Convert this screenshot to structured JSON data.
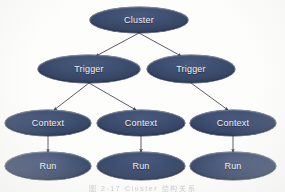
{
  "diagram": {
    "background_color": "#fdfdfc",
    "node_fill_color": "#3f4f71",
    "node_text_color": "#f2f3f6",
    "edge_color": "#4a4a52",
    "levels": [
      {
        "name": "cluster-level",
        "nodes": [
          {
            "id": "cluster",
            "label": "Cluster",
            "cx": 139,
            "cy": 20,
            "rx": 49,
            "ry": 13
          }
        ]
      },
      {
        "name": "trigger-level",
        "nodes": [
          {
            "id": "trigger-left",
            "label": "Trigger",
            "cx": 89,
            "cy": 69,
            "rx": 51,
            "ry": 14
          },
          {
            "id": "trigger-right",
            "label": "Trigger",
            "cx": 191,
            "cy": 69,
            "rx": 44,
            "ry": 14
          }
        ]
      },
      {
        "name": "context-level",
        "nodes": [
          {
            "id": "context-1",
            "label": "Context",
            "cx": 48,
            "cy": 123,
            "rx": 43,
            "ry": 13
          },
          {
            "id": "context-2",
            "label": "Context",
            "cx": 141,
            "cy": 123,
            "rx": 44,
            "ry": 13
          },
          {
            "id": "context-3",
            "label": "Context",
            "cx": 233,
            "cy": 123,
            "rx": 43,
            "ry": 13
          }
        ]
      },
      {
        "name": "run-level",
        "nodes": [
          {
            "id": "run-1",
            "label": "Run",
            "cx": 48,
            "cy": 166,
            "rx": 43,
            "ry": 14
          },
          {
            "id": "run-2",
            "label": "Run",
            "cx": 141,
            "cy": 166,
            "rx": 44,
            "ry": 14
          },
          {
            "id": "run-3",
            "label": "Run",
            "cx": 233,
            "cy": 166,
            "rx": 43,
            "ry": 14
          }
        ]
      }
    ],
    "edges": [
      {
        "id": "edge-cluster-trigger-left",
        "from": "cluster",
        "to": "trigger-left",
        "x1": 139,
        "y1": 33,
        "x2": 96,
        "y2": 56,
        "arrow": true
      },
      {
        "id": "edge-cluster-trigger-right",
        "from": "cluster",
        "to": "trigger-right",
        "x1": 139,
        "y1": 33,
        "x2": 181,
        "y2": 56,
        "arrow": true
      },
      {
        "id": "edge-trigger-left-context-1",
        "from": "trigger-left",
        "to": "context-1",
        "x1": 89,
        "y1": 83,
        "x2": 54,
        "y2": 110,
        "arrow": true
      },
      {
        "id": "edge-trigger-left-context-2",
        "from": "trigger-left",
        "to": "context-2",
        "x1": 89,
        "y1": 83,
        "x2": 136,
        "y2": 110,
        "arrow": true
      },
      {
        "id": "edge-trigger-right-context-3",
        "from": "trigger-right",
        "to": "context-3",
        "x1": 191,
        "y1": 83,
        "x2": 228,
        "y2": 110,
        "arrow": true
      },
      {
        "id": "edge-context-1-run-1",
        "from": "context-1",
        "to": "run-1",
        "x1": 48,
        "y1": 136,
        "x2": 48,
        "y2": 152,
        "arrow": true
      },
      {
        "id": "edge-context-2-run-2",
        "from": "context-2",
        "to": "run-2",
        "x1": 141,
        "y1": 136,
        "x2": 141,
        "y2": 152,
        "arrow": true
      },
      {
        "id": "edge-context-3-run-3",
        "from": "context-3",
        "to": "run-3",
        "x1": 233,
        "y1": 136,
        "x2": 233,
        "y2": 152,
        "arrow": true
      }
    ],
    "caption": "图 2-17  Cluster 结构关系"
  }
}
